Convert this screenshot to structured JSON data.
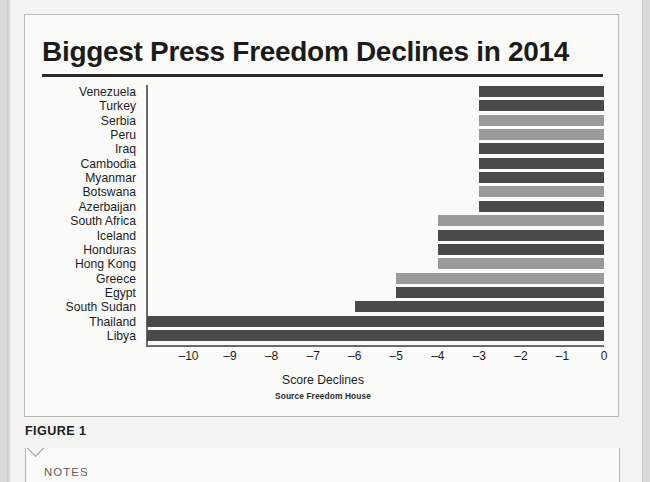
{
  "document": {
    "figure_caption": "FIGURE 1",
    "notes_label": "NOTES"
  },
  "chart_data": {
    "type": "bar",
    "orientation": "horizontal",
    "title": "Biggest Press Freedom Declines in 2014",
    "xlabel": "Score Declines",
    "ylabel": "",
    "source": "Source Freedom House",
    "xlim": [
      -11,
      0
    ],
    "xticks": [
      -10,
      -9,
      -8,
      -7,
      -6,
      -5,
      -4,
      -3,
      -2,
      -1,
      0
    ],
    "xtick_labels": [
      "–10",
      "–9",
      "–8",
      "–7",
      "–6",
      "–5",
      "–4",
      "–3",
      "–2",
      "–1",
      "0"
    ],
    "grid": false,
    "legend": false,
    "categories": [
      "Venezuela",
      "Turkey",
      "Serbia",
      "Peru",
      "Iraq",
      "Cambodia",
      "Myanmar",
      "Botswana",
      "Azerbaijan",
      "South Africa",
      "Iceland",
      "Honduras",
      "Hong Kong",
      "Greece",
      "Egypt",
      "South Sudan",
      "Thailand",
      "Libya"
    ],
    "values": [
      -3,
      -3,
      -3,
      -3,
      -3,
      -3,
      -3,
      -3,
      -3,
      -4,
      -4,
      -4,
      -4,
      -5,
      -5,
      -6,
      -11,
      -11
    ],
    "bar_shades": [
      "dark",
      "dark",
      "light",
      "light",
      "dark",
      "dark",
      "dark",
      "light",
      "dark",
      "light",
      "dark",
      "dark",
      "light",
      "light",
      "dark",
      "dark",
      "dark",
      "dark"
    ],
    "colors": {
      "dark": "#4a4a4a",
      "light": "#9a9a9a",
      "axis": "#6a6a6a",
      "title_rule": "#2c2c2c",
      "text": "#1d1d1d"
    }
  }
}
